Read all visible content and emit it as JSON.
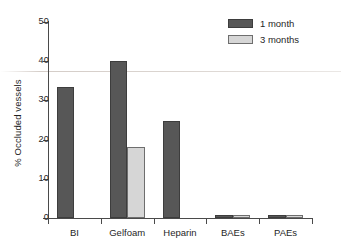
{
  "chart_data": {
    "type": "bar",
    "title": "",
    "xlabel": "",
    "ylabel": "% Occluded vessels",
    "categories": [
      "BI",
      "Gelfoam",
      "Heparin",
      "BAEs",
      "PAEs"
    ],
    "series": [
      {
        "name": "1 month",
        "color": "#575757",
        "values": [
          33.3,
          40.0,
          24.8,
          0.7,
          0.7
        ]
      },
      {
        "name": "3 months",
        "color": "#d6d6d6",
        "values": [
          0,
          18.2,
          0,
          0.7,
          0.7
        ]
      }
    ],
    "ylim": [
      0,
      50
    ],
    "yticks": [
      0,
      10,
      20,
      30,
      40,
      50
    ],
    "ytick_labels": [
      "0",
      "10",
      "20",
      "30",
      "40",
      "50"
    ],
    "grid": false,
    "legend_position": "top-right"
  },
  "legend": {
    "items": [
      {
        "label": "1 month"
      },
      {
        "label": "3 months"
      }
    ]
  },
  "colors": {
    "series_1": "#575757",
    "series_2": "#d6d6d6",
    "axis": "#4a4a4a",
    "text": "#1f1f1f",
    "background": "#ffffff"
  }
}
